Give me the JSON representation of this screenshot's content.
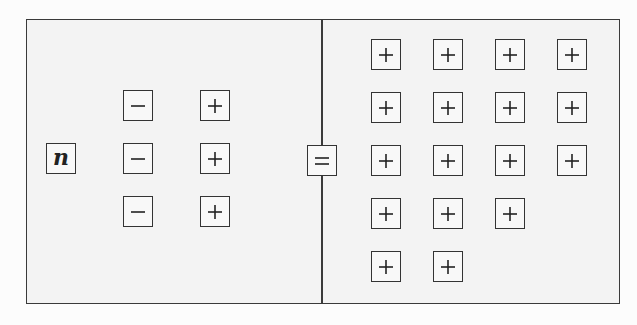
{
  "diagram": {
    "colors": {
      "border": "#333333",
      "panel_background": "#f3f3f3",
      "tile_background": "#f8f8f8"
    },
    "left_panel": {
      "variable_tile": {
        "label": "n",
        "x": 46,
        "y": 143
      },
      "negative_tiles": [
        {
          "symbol": "minus",
          "x": 123,
          "y": 90
        },
        {
          "symbol": "minus",
          "x": 123,
          "y": 143
        },
        {
          "symbol": "minus",
          "x": 123,
          "y": 196
        }
      ],
      "positive_tiles": [
        {
          "symbol": "plus",
          "x": 200,
          "y": 90
        },
        {
          "symbol": "plus",
          "x": 200,
          "y": 143
        },
        {
          "symbol": "plus",
          "x": 200,
          "y": 196
        }
      ]
    },
    "equals_tile": {
      "symbol": "equals",
      "x": 307,
      "y": 145
    },
    "right_panel": {
      "rows": [
        4,
        4,
        4,
        3,
        2
      ],
      "total_positive": 17,
      "column_x": [
        371,
        433,
        495,
        557
      ],
      "row_y": [
        39,
        92,
        145,
        198,
        251
      ]
    }
  }
}
